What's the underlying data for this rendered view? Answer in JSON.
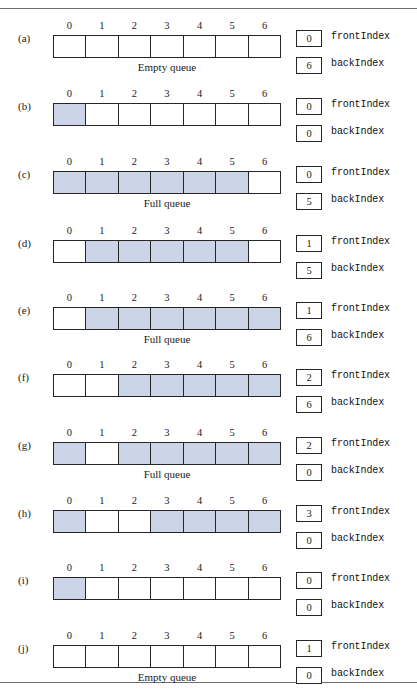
{
  "figure": {
    "column_headers": [
      "0",
      "1",
      "2",
      "3",
      "4",
      "5",
      "6"
    ],
    "fill_color": "#ccd4e8",
    "border_color": "#262626",
    "front_label": "frontIndex",
    "back_label": "backIndex",
    "captions": {
      "empty": "Empty queue",
      "full": "Full queue"
    },
    "rows": [
      {
        "label": "(a)",
        "cells": [
          false,
          false,
          false,
          false,
          false,
          false,
          false
        ],
        "caption": "Empty queue",
        "frontIndex": "0",
        "backIndex": "6"
      },
      {
        "label": "(b)",
        "cells": [
          true,
          false,
          false,
          false,
          false,
          false,
          false
        ],
        "caption": "",
        "frontIndex": "0",
        "backIndex": "0"
      },
      {
        "label": "(c)",
        "cells": [
          true,
          true,
          true,
          true,
          true,
          true,
          false
        ],
        "caption": "Full queue",
        "frontIndex": "0",
        "backIndex": "5"
      },
      {
        "label": "(d)",
        "cells": [
          false,
          true,
          true,
          true,
          true,
          true,
          false
        ],
        "caption": "",
        "frontIndex": "1",
        "backIndex": "5"
      },
      {
        "label": "(e)",
        "cells": [
          false,
          true,
          true,
          true,
          true,
          true,
          true
        ],
        "caption": "Full queue",
        "frontIndex": "1",
        "backIndex": "6"
      },
      {
        "label": "(f)",
        "cells": [
          false,
          false,
          true,
          true,
          true,
          true,
          true
        ],
        "caption": "",
        "frontIndex": "2",
        "backIndex": "6"
      },
      {
        "label": "(g)",
        "cells": [
          true,
          false,
          true,
          true,
          true,
          true,
          true
        ],
        "caption": "Full queue",
        "frontIndex": "2",
        "backIndex": "0"
      },
      {
        "label": "(h)",
        "cells": [
          true,
          false,
          false,
          true,
          true,
          true,
          true
        ],
        "caption": "",
        "frontIndex": "3",
        "backIndex": "0"
      },
      {
        "label": "(i)",
        "cells": [
          true,
          false,
          false,
          false,
          false,
          false,
          false
        ],
        "caption": "",
        "frontIndex": "0",
        "backIndex": "0"
      },
      {
        "label": "(j)",
        "cells": [
          false,
          false,
          false,
          false,
          false,
          false,
          false
        ],
        "caption": "Empty queue",
        "frontIndex": "1",
        "backIndex": "0"
      }
    ]
  }
}
